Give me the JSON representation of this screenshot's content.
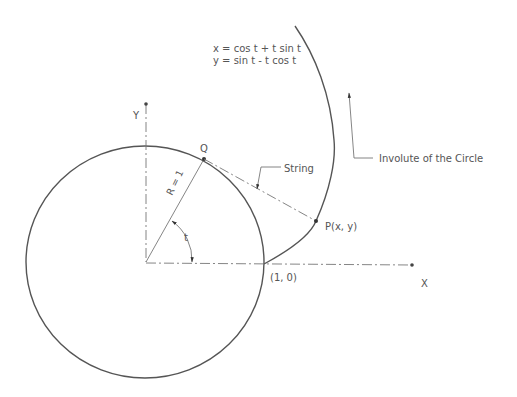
{
  "diagram": {
    "title": "Involute of the Circle",
    "equations": {
      "x": "x = cos t + t sin t",
      "y": "y = sin t - t cos t"
    },
    "labels": {
      "x_axis": "X",
      "y_axis": "Y",
      "point_q": "Q",
      "point_p": "P(x, y)",
      "point_start": "(1, 0)",
      "radius": "R = 1",
      "angle": "t",
      "string": "String",
      "involute": "Involute of the Circle"
    },
    "colors": {
      "stroke": "#555555",
      "centerline": "#777777",
      "background": "#ffffff"
    }
  }
}
